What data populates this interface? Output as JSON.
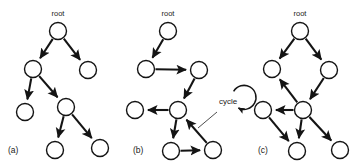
{
  "figure": {
    "width": 360,
    "height": 168,
    "background_color": "#ffffff",
    "stroke_color": "#141414",
    "node_fill_color": "#ffffff",
    "node_radius": 8.5
  },
  "panels": [
    {
      "id": "a",
      "caption": "(a)",
      "caption_x": 8,
      "caption_y": 153,
      "root_label": "root",
      "root_label_x": 58,
      "root_label_y": 16,
      "description": "tree",
      "nodes": [
        {
          "name": "a-root",
          "x": 58,
          "y": 31
        },
        {
          "name": "a-n1",
          "x": 33,
          "y": 69
        },
        {
          "name": "a-n2",
          "x": 88,
          "y": 70
        },
        {
          "name": "a-n3",
          "x": 25,
          "y": 112
        },
        {
          "name": "a-n4",
          "x": 66,
          "y": 107
        },
        {
          "name": "a-n5",
          "x": 55,
          "y": 150
        },
        {
          "name": "a-n6",
          "x": 100,
          "y": 148
        }
      ],
      "edges": [
        {
          "from": "a-root",
          "to": "a-n1"
        },
        {
          "from": "a-root",
          "to": "a-n2"
        },
        {
          "from": "a-n1",
          "to": "a-n3"
        },
        {
          "from": "a-n1",
          "to": "a-n4"
        },
        {
          "from": "a-n4",
          "to": "a-n5"
        },
        {
          "from": "a-n4",
          "to": "a-n6"
        }
      ]
    },
    {
      "id": "b",
      "caption": "(b)",
      "caption_x": 133,
      "caption_y": 153,
      "root_label": "root",
      "root_label_x": 168,
      "root_label_y": 16,
      "description": "graph-with-cycle",
      "annotation": {
        "text": "cycle",
        "text_x": 228,
        "text_y": 104,
        "arc_cx": 228,
        "arc_cy": 102,
        "arc_r": 12,
        "leader_from_x": 217,
        "leader_from_y": 112,
        "leader_to_x": 198,
        "leader_to_y": 128
      },
      "nodes": [
        {
          "name": "b-root",
          "x": 168,
          "y": 31
        },
        {
          "name": "b-n1",
          "x": 146,
          "y": 69
        },
        {
          "name": "b-n2",
          "x": 199,
          "y": 70
        },
        {
          "name": "b-n3",
          "x": 178,
          "y": 110
        },
        {
          "name": "b-n4",
          "x": 135,
          "y": 110
        },
        {
          "name": "b-n5",
          "x": 171,
          "y": 151
        },
        {
          "name": "b-n6",
          "x": 213,
          "y": 150
        }
      ],
      "edges": [
        {
          "from": "b-root",
          "to": "b-n1"
        },
        {
          "from": "b-n1",
          "to": "b-n2"
        },
        {
          "from": "b-n2",
          "to": "b-n3"
        },
        {
          "from": "b-n3",
          "to": "b-n4"
        },
        {
          "from": "b-n3",
          "to": "b-n5"
        },
        {
          "from": "b-n5",
          "to": "b-n6"
        },
        {
          "from": "b-n6",
          "to": "b-n3"
        }
      ]
    },
    {
      "id": "c",
      "caption": "(c)",
      "caption_x": 258,
      "caption_y": 153,
      "root_label": "root",
      "root_label_x": 300,
      "root_label_y": 16,
      "description": "dag",
      "nodes": [
        {
          "name": "c-root",
          "x": 300,
          "y": 31
        },
        {
          "name": "c-n1",
          "x": 272,
          "y": 69
        },
        {
          "name": "c-n2",
          "x": 329,
          "y": 70
        },
        {
          "name": "c-n3",
          "x": 303,
          "y": 110
        },
        {
          "name": "c-n4",
          "x": 263,
          "y": 110
        },
        {
          "name": "c-n5",
          "x": 297,
          "y": 151
        },
        {
          "name": "c-n6",
          "x": 340,
          "y": 150
        }
      ],
      "edges": [
        {
          "from": "c-root",
          "to": "c-n1"
        },
        {
          "from": "c-root",
          "to": "c-n2"
        },
        {
          "from": "c-n2",
          "to": "c-n3"
        },
        {
          "from": "c-n3",
          "to": "c-n1"
        },
        {
          "from": "c-n3",
          "to": "c-n4"
        },
        {
          "from": "c-n3",
          "to": "c-n5"
        },
        {
          "from": "c-n3",
          "to": "c-n6"
        },
        {
          "from": "c-n4",
          "to": "c-n5"
        }
      ]
    }
  ]
}
